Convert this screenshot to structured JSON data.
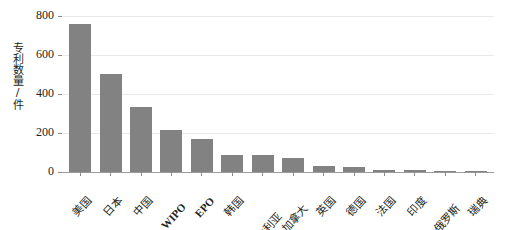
{
  "chart_data": {
    "type": "bar",
    "title": "",
    "subtitle": "",
    "xlabel": "",
    "ylabel": "专利数量/件",
    "ylim": [
      0,
      800
    ],
    "yticks": [
      0,
      200,
      400,
      600,
      800
    ],
    "grid": true,
    "legend": null,
    "bar_color": "#828282",
    "categories": [
      "美国",
      "日本",
      "中国",
      "WIPO",
      "EPO",
      "韩国",
      "澳大利亚",
      "加拿大",
      "英国",
      "德国",
      "法国",
      "印度",
      "俄罗斯",
      "瑞典"
    ],
    "category_scripts": [
      "cjk",
      "cjk",
      "cjk",
      "latin",
      "latin",
      "cjk",
      "cjk",
      "cjk",
      "cjk",
      "cjk",
      "cjk",
      "cjk",
      "cjk",
      "cjk"
    ],
    "values": [
      758,
      505,
      333,
      213,
      167,
      87,
      85,
      74,
      32,
      28,
      12,
      12,
      7,
      5
    ]
  },
  "axis": {
    "y_title": "专利数量/件",
    "y_tick_labels": [
      "800",
      "600",
      "400",
      "200",
      "0"
    ]
  }
}
